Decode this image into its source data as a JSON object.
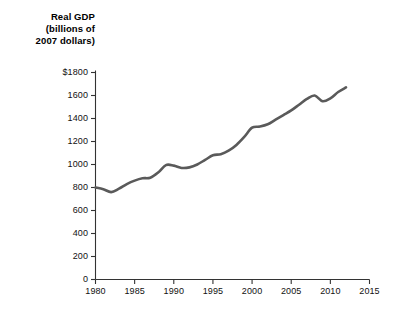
{
  "chart_data": {
    "type": "line",
    "title": "Real GDP (billions of 2007 dollars)",
    "title_lines": [
      "Real GDP",
      "(billions of",
      "2007 dollars)"
    ],
    "xlabel": "",
    "ylabel": "Real GDP (billions of 2007 dollars)",
    "xlim": [
      1980,
      2015
    ],
    "ylim": [
      0,
      1800
    ],
    "grid": false,
    "legend": "none",
    "line_color": "#5a5a5a",
    "axis_color": "#333333",
    "background_color": "#ffffff",
    "ytick_labels": [
      "0",
      "200",
      "400",
      "600",
      "800",
      "1000",
      "1200",
      "1400",
      "1600",
      "$1800"
    ],
    "ytick_values": [
      0,
      200,
      400,
      600,
      800,
      1000,
      1200,
      1400,
      1600,
      1800
    ],
    "xtick_labels": [
      "1980",
      "1985",
      "1990",
      "1995",
      "2000",
      "2005",
      "2010",
      "2015"
    ],
    "xtick_values": [
      1980,
      1985,
      1990,
      1995,
      2000,
      2005,
      2010,
      2015
    ],
    "x": [
      1980,
      1981,
      1982,
      1983,
      1984,
      1985,
      1986,
      1987,
      1988,
      1989,
      1990,
      1991,
      1992,
      1993,
      1994,
      1995,
      1996,
      1997,
      1998,
      1999,
      2000,
      2001,
      2002,
      2003,
      2004,
      2005,
      2006,
      2007,
      2008,
      2009,
      2010,
      2011,
      2012
    ],
    "values": [
      800,
      785,
      760,
      790,
      830,
      860,
      880,
      885,
      930,
      995,
      990,
      970,
      975,
      1000,
      1040,
      1080,
      1090,
      1120,
      1170,
      1240,
      1320,
      1330,
      1350,
      1390,
      1430,
      1470,
      1520,
      1570,
      1600,
      1550,
      1575,
      1630,
      1670
    ]
  }
}
